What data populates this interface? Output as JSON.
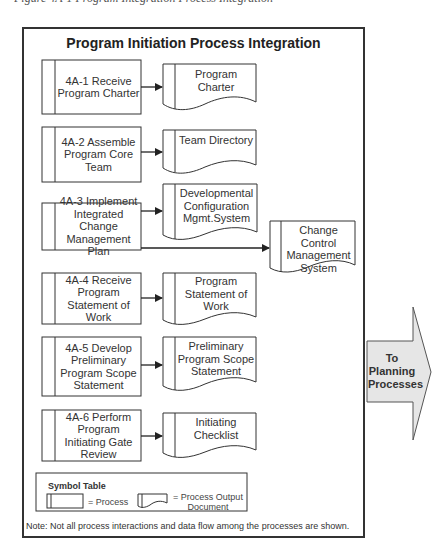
{
  "diagram": {
    "cut_caption": "Figure 4A-1 Program Integration Process Integration",
    "title": "Program Initiation Process Integration",
    "processes": [
      {
        "id": "4A-1",
        "label": "4A-1 Receive Program Charter",
        "output": "Program Charter"
      },
      {
        "id": "4A-2",
        "label": "4A-2 Assemble Program Core Team",
        "output": "Team Directory"
      },
      {
        "id": "4A-3",
        "label": "4A-3 Implement Integrated Change Management Plan",
        "output": "Developmental Configuration Mgmt.System",
        "output2": "Change Control Management System"
      },
      {
        "id": "4A-4",
        "label": "4A-4 Receive Program Statement of Work",
        "output": "Program Statement of Work"
      },
      {
        "id": "4A-5",
        "label": "4A-5 Develop Preliminary Program Scope Statement",
        "output": "Preliminary Program Scope Statement"
      },
      {
        "id": "4A-6",
        "label": "4A-6 Perform Program Initiating Gate Review",
        "output": "Initiating Checklist"
      }
    ],
    "symbol_table": {
      "title": "Symbol Table",
      "process_label": "= Process",
      "document_label": "= Process Output Document"
    },
    "note": "Note: Not all process interactions and data flow among the processes are shown.",
    "next_step_arrow": "To Planning Processes",
    "colors": {
      "stroke": "#333333",
      "arrow_fill": "#e6e6e6",
      "text": "#333333"
    }
  }
}
